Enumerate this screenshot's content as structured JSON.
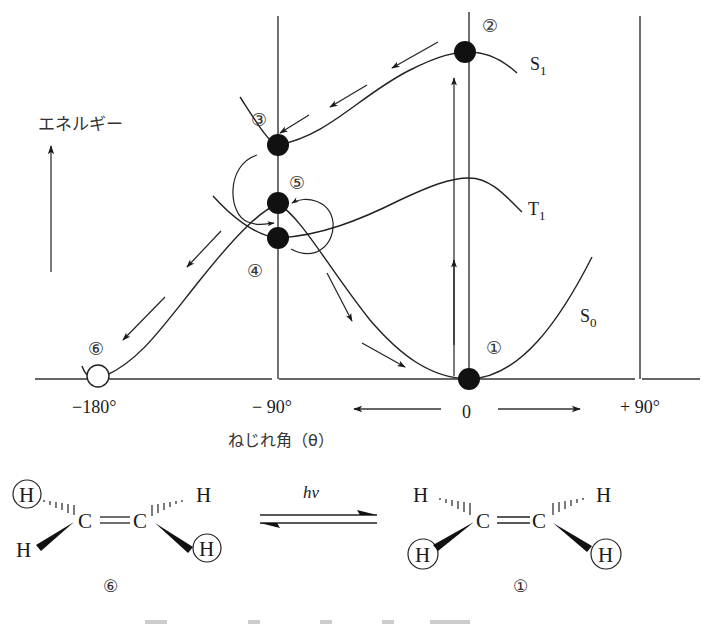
{
  "energy_diagram": {
    "y_axis_label": "エネルギー",
    "x_axis_label": "ねじれ角（θ）",
    "x_ticks": [
      "−180°",
      "− 90°",
      "0",
      "+ 90°"
    ],
    "curves": {
      "s1": {
        "label": "S",
        "sub": "1"
      },
      "t1": {
        "label": "T",
        "sub": "1"
      },
      "s0": {
        "label": "S",
        "sub": "0"
      }
    },
    "points": {
      "p1": "①",
      "p2": "②",
      "p3": "③",
      "p4": "④",
      "p5": "⑤",
      "p6": "⑥"
    }
  },
  "reaction": {
    "left_molecule": {
      "carbon_left": "C",
      "carbon_right": "C",
      "h_top_left": "H",
      "h_top_right": "H",
      "h_bottom_left": "H",
      "h_bottom_right": "H",
      "label": "⑥"
    },
    "arrow_label": "hv",
    "right_molecule": {
      "carbon_left": "C",
      "carbon_right": "C",
      "h_top_left": "H",
      "h_top_right": "H",
      "h_bottom_left": "H",
      "h_bottom_right": "H",
      "label": "①"
    }
  }
}
